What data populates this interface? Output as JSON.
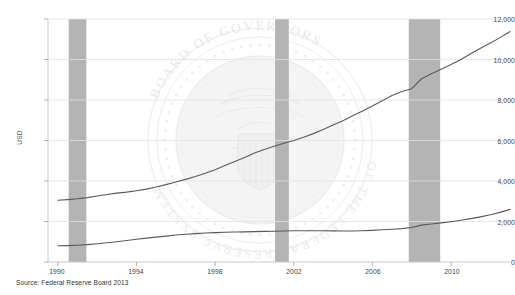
{
  "chart_data": {
    "type": "line",
    "title": "",
    "subtitle": "",
    "xlabel": "",
    "ylabel": "USD",
    "xlim": [
      1989.5,
      2013.0
    ],
    "ylim": [
      0,
      12000
    ],
    "grid": true,
    "legend": false,
    "legend_position": "none",
    "y_ticks": [
      "0",
      "2,000",
      "4,000",
      "6,000",
      "8,000",
      "10,000",
      "12,000"
    ],
    "y_tick_values": [
      0,
      2000,
      4000,
      6000,
      8000,
      10000,
      12000
    ],
    "x_ticks": [
      "1990",
      "1994",
      "1998",
      "2002",
      "2006",
      "2010"
    ],
    "x_tick_values": [
      1990,
      1994,
      1998,
      2002,
      2006,
      2010
    ],
    "series": [
      {
        "name": "upper-series",
        "color": "#595959",
        "x": [
          1990.0,
          1990.5,
          1991.0,
          1991.5,
          1992.0,
          1992.5,
          1993.0,
          1993.5,
          1994.0,
          1994.5,
          1995.0,
          1995.5,
          1996.0,
          1996.5,
          1997.0,
          1997.5,
          1998.0,
          1998.5,
          1999.0,
          1999.5,
          2000.0,
          2000.5,
          2001.0,
          2001.5,
          2002.0,
          2002.5,
          2003.0,
          2003.5,
          2004.0,
          2004.5,
          2005.0,
          2005.5,
          2006.0,
          2006.5,
          2007.0,
          2007.5,
          2008.0,
          2008.5,
          2009.0,
          2009.5,
          2010.0,
          2010.5,
          2011.0,
          2011.5,
          2012.0,
          2012.5,
          2013.0
        ],
        "values": [
          3050,
          3080,
          3120,
          3180,
          3260,
          3330,
          3400,
          3450,
          3520,
          3600,
          3700,
          3820,
          3950,
          4080,
          4220,
          4380,
          4560,
          4760,
          4960,
          5160,
          5380,
          5560,
          5720,
          5860,
          6000,
          6160,
          6340,
          6540,
          6760,
          6980,
          7220,
          7460,
          7700,
          7960,
          8220,
          8420,
          8560,
          9050,
          9300,
          9520,
          9750,
          10000,
          10280,
          10560,
          10820,
          11080,
          11380
        ]
      },
      {
        "name": "lower-series",
        "color": "#595959",
        "x": [
          1990.0,
          1990.5,
          1991.0,
          1991.5,
          1992.0,
          1992.5,
          1993.0,
          1993.5,
          1994.0,
          1994.5,
          1995.0,
          1995.5,
          1996.0,
          1996.5,
          1997.0,
          1997.5,
          1998.0,
          1998.5,
          1999.0,
          1999.5,
          2000.0,
          2000.5,
          2001.0,
          2001.5,
          2002.0,
          2002.5,
          2003.0,
          2003.5,
          2004.0,
          2004.5,
          2005.0,
          2005.5,
          2006.0,
          2006.5,
          2007.0,
          2007.5,
          2008.0,
          2008.5,
          2009.0,
          2009.5,
          2010.0,
          2010.5,
          2011.0,
          2011.5,
          2012.0,
          2012.5,
          2013.0
        ],
        "values": [
          800,
          810,
          830,
          860,
          900,
          950,
          1000,
          1060,
          1120,
          1180,
          1230,
          1280,
          1330,
          1370,
          1400,
          1430,
          1450,
          1470,
          1480,
          1490,
          1500,
          1510,
          1520,
          1530,
          1540,
          1545,
          1545,
          1540,
          1535,
          1530,
          1530,
          1540,
          1560,
          1590,
          1620,
          1650,
          1700,
          1820,
          1880,
          1930,
          1990,
          2060,
          2140,
          2230,
          2330,
          2450,
          2600
        ]
      }
    ],
    "shaded_bands": [
      {
        "name": "recession-band-1",
        "x0": 1990.55,
        "x1": 1991.45,
        "color": "#b4b4b4"
      },
      {
        "name": "recession-band-2",
        "x0": 2001.05,
        "x1": 2001.75,
        "color": "#b4b4b4"
      },
      {
        "name": "recession-band-3",
        "x0": 2007.85,
        "x1": 2009.45,
        "color": "#b4b4b4"
      }
    ],
    "watermark": {
      "name": "federal-reserve-seal-watermark",
      "outer_text": "BOARD OF GOVERNORS OF THE FEDERAL RESERVE SYSTEM",
      "color": "#ebebeb"
    }
  },
  "source": {
    "text": "Source: Federal Reserve Board 2013"
  }
}
